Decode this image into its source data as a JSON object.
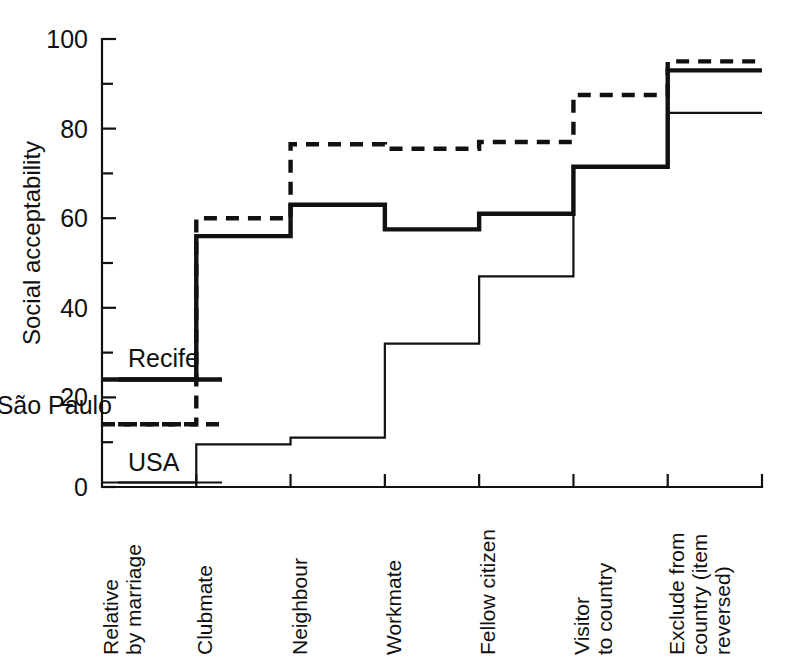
{
  "chart_data": {
    "type": "line",
    "subtype": "step",
    "title": "",
    "xlabel": "",
    "ylabel": "Social acceptability",
    "ylim": [
      0,
      100
    ],
    "ytick_values": [
      0,
      20,
      40,
      60,
      80,
      100
    ],
    "ytick_labels": [
      "0",
      "20",
      "40",
      "60",
      "80",
      "100"
    ],
    "yminor_ticks": [
      10,
      30,
      50,
      70,
      90
    ],
    "grid": false,
    "legend_position": "inline-left",
    "categories": [
      "Relative\nby marriage",
      "Clubmate",
      "Neighbour",
      "Workmate",
      "Fellow citizen",
      "Visitor\nto country",
      "Exclude from\ncountry (item\nreversed)"
    ],
    "category_lines": [
      [
        "Relative",
        "by marriage"
      ],
      [
        "Clubmate"
      ],
      [
        "Neighbour"
      ],
      [
        "Workmate"
      ],
      [
        "Fellow citizen"
      ],
      [
        "Visitor",
        "to country"
      ],
      [
        "Exclude from",
        "country (item",
        "reversed)"
      ]
    ],
    "series": [
      {
        "name": "Recife",
        "style": "solid-thick",
        "values": [
          24,
          56,
          63,
          57.5,
          61,
          71.5,
          93
        ]
      },
      {
        "name": "São Paulo",
        "style": "dashed-thick",
        "values": [
          14,
          60,
          76.5,
          75.5,
          77,
          87.5,
          95
        ]
      },
      {
        "name": "USA",
        "style": "solid-thin",
        "values": [
          1,
          9.5,
          11,
          32,
          47,
          71.5,
          83.5
        ]
      }
    ]
  },
  "legend": {
    "items": [
      {
        "label": "Recife",
        "style": "solid-thick"
      },
      {
        "label": "São Paulo",
        "style": "dashed-thick"
      },
      {
        "label": "USA",
        "style": "solid-thin"
      }
    ]
  },
  "axis": {
    "y_title": "Social acceptability"
  }
}
